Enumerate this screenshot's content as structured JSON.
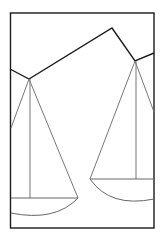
{
  "diagram": {
    "title": "",
    "colors": {
      "background": "#ffffff",
      "frame": "#1a1a1a",
      "beam": "#1a1a1a",
      "strings": "#777777",
      "pans": "#666666"
    },
    "frame": {
      "x": 10,
      "y": 13,
      "width": 144,
      "height": 215
    },
    "beam_points": [
      [
        10,
        69
      ],
      [
        29,
        79
      ],
      [
        112,
        28
      ],
      [
        135,
        61
      ],
      [
        154,
        53
      ]
    ],
    "left_pan": {
      "pivot": [
        29,
        79
      ],
      "strings": [
        [
          12,
          128
        ],
        [
          78,
          198
        ]
      ],
      "center_line_bottom": [
        30,
        198
      ],
      "rim_y": 198,
      "rim_x": [
        11,
        78
      ],
      "arc_bottom": [
        40,
        218
      ]
    },
    "right_pan": {
      "pivot": [
        135,
        61
      ],
      "strings": [
        [
          90,
          179
        ],
        [
          154,
          111
        ]
      ],
      "center_line_bottom": [
        136,
        179
      ],
      "rim_y": 179,
      "rim_x": [
        90,
        154
      ],
      "arc_bottom": [
        130,
        202
      ]
    }
  }
}
